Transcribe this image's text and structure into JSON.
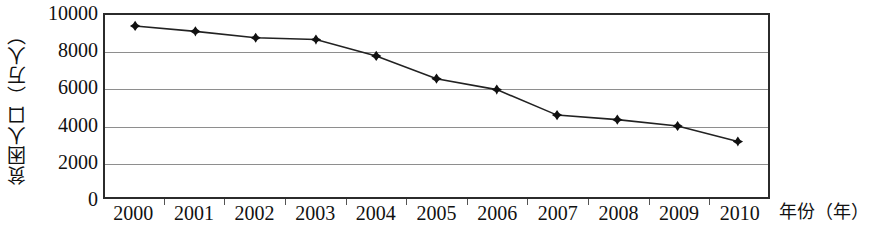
{
  "chart_data": {
    "type": "line",
    "title": "",
    "xlabel": "年份（年）",
    "ylabel": "贫困人口（万人）",
    "categories": [
      "2000",
      "2001",
      "2002",
      "2003",
      "2004",
      "2005",
      "2006",
      "2007",
      "2008",
      "2009",
      "2010"
    ],
    "values": [
      9400,
      9100,
      8750,
      8650,
      7750,
      6500,
      5900,
      4500,
      4250,
      3900,
      3050
    ],
    "series": [
      {
        "name": "贫困人口",
        "values": [
          9400,
          9100,
          8750,
          8650,
          7750,
          6500,
          5900,
          4500,
          4250,
          3900,
          3050
        ]
      }
    ],
    "ylim": [
      0,
      10000
    ],
    "y_ticks": [
      0,
      2000,
      4000,
      6000,
      8000,
      10000
    ],
    "y_tick_labels": [
      "0",
      "2000",
      "4000",
      "6000",
      "8000",
      "10000"
    ],
    "grid": true,
    "gridlines_at": [
      2000,
      4000,
      6000,
      8000
    ],
    "legend": false,
    "legend_position": "none",
    "marker": "diamond",
    "marker_color": "#111111",
    "line_color": "#222222",
    "plot_border_color": "#2b2b2b",
    "grid_color": "#8e8e8e",
    "background": "#ffffff"
  },
  "axis": {
    "y_title": "贫困人口（万人）",
    "x_title": "年份（年）"
  }
}
